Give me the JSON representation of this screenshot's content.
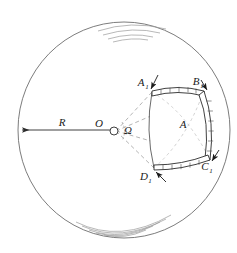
{
  "figure": {
    "kind": "geometry-diagram",
    "background_color": "#ffffff",
    "stroke_color": "#3a3a3a",
    "hatch_color": "#8a8a8a",
    "band_color": "#2b2b2b"
  },
  "sphere": {
    "name": "great-circle-outline",
    "center_x": 124,
    "center_y": 130,
    "radius_x": 106,
    "radius_y": 108,
    "shading_top": {
      "name": "top-shading-arcs",
      "arc_count": 4
    },
    "shading_bottom": {
      "name": "bottom-shading-arcs",
      "arc_count": 5
    }
  },
  "radius": {
    "label": "R",
    "label_x": 62,
    "label_y": 126,
    "line_x1": 20,
    "line_x2": 115,
    "line_y": 130,
    "arrow_at": "left"
  },
  "vertex": {
    "label": "O",
    "label_x": 99,
    "label_y": 127,
    "dot_x": 114,
    "dot_y": 131,
    "dot_r": 4
  },
  "solid_angle": {
    "label": "Ω",
    "label_x": 128,
    "label_y": 134
  },
  "patch": {
    "label": "A",
    "label_x": 183,
    "label_y": 128
  },
  "corners": [
    {
      "label": "A",
      "sub": "1",
      "label_x": 141,
      "label_y": 86,
      "point_x": 153,
      "point_y": 92,
      "arrow": true
    },
    {
      "label": "B",
      "sub": "1",
      "label_x": 196,
      "label_y": 85,
      "point_x": 205,
      "point_y": 92,
      "arrow": true
    },
    {
      "label": "C",
      "sub": "1",
      "label_x": 205,
      "label_y": 170,
      "point_x": 211,
      "point_y": 159,
      "arrow": true
    },
    {
      "label": "D",
      "sub": "1",
      "label_x": 144,
      "label_y": 180,
      "point_x": 155,
      "point_y": 169,
      "arrow": true
    }
  ],
  "cone_edges": {
    "name": "dashed-cone-generators",
    "style": "dashed",
    "count": 4
  }
}
